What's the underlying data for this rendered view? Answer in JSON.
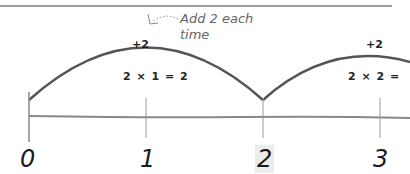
{
  "annotation": {
    "line1": "Add 2 each",
    "line2": "time"
  },
  "jumps": [
    {
      "label": "+2",
      "equation": "2 × 1 = 2"
    },
    {
      "label": "+2",
      "equation": "2 × 2 ="
    }
  ],
  "number_line": {
    "ticks": [
      "0",
      "1",
      "2",
      "3"
    ]
  },
  "colors": {
    "line": "#777777",
    "arc": "#555555",
    "text": "#222222",
    "note": "#666666"
  }
}
